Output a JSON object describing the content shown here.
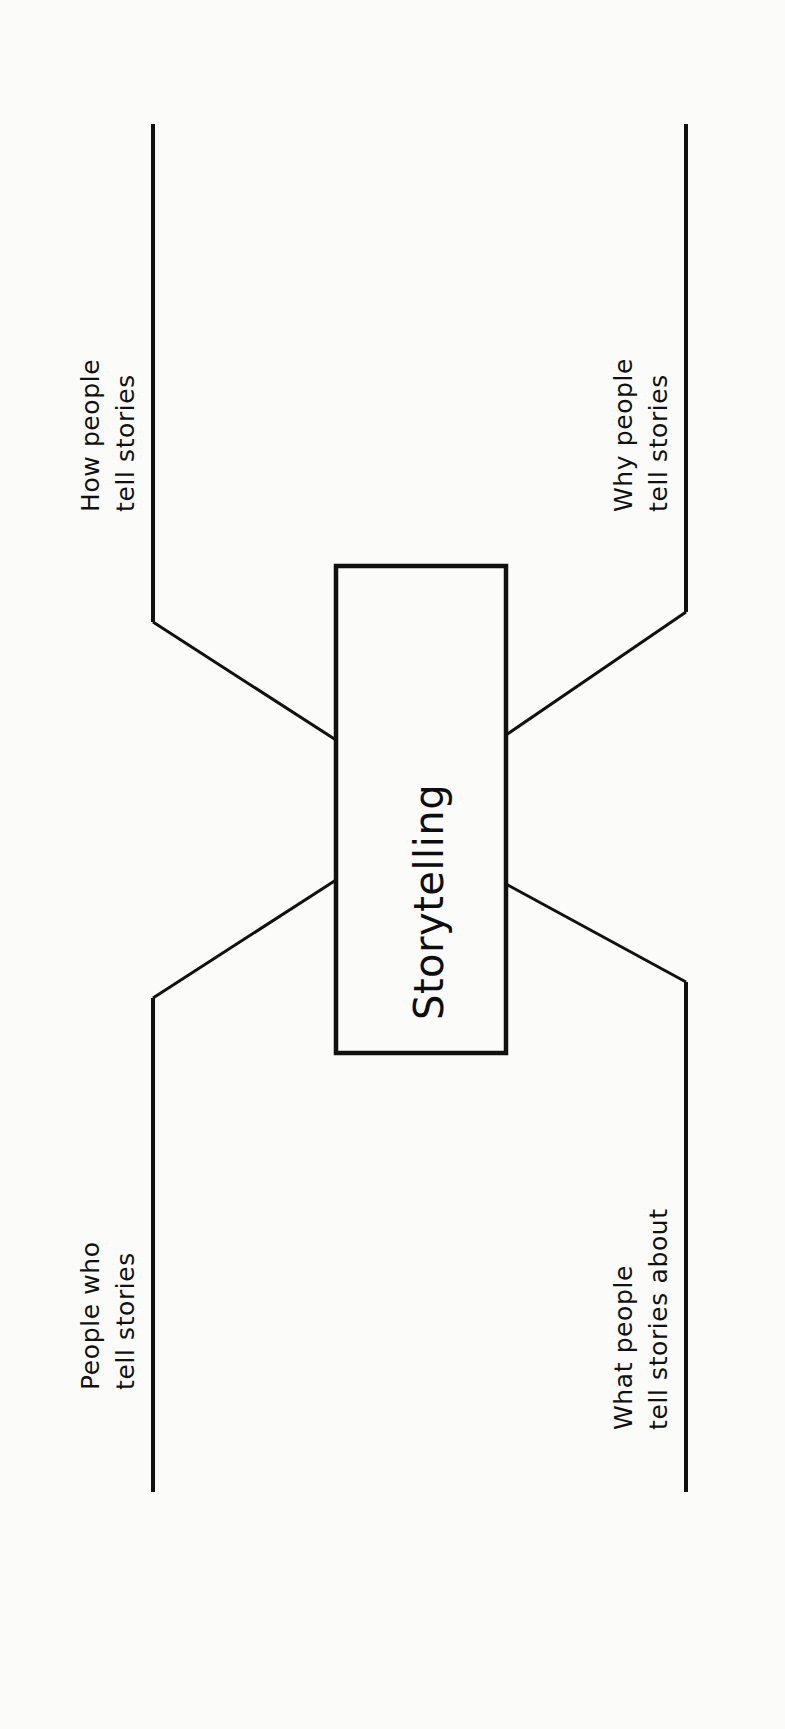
{
  "diagram": {
    "type": "fishbone-spider-diagram",
    "orientation": "rotated-90-counterclockwise",
    "center": {
      "label": "Storytelling"
    },
    "branches": [
      {
        "id": "how-people-tell-stories",
        "position": "top-left",
        "line1": "How people",
        "line2": "tell stories"
      },
      {
        "id": "why-people-tell-stories",
        "position": "top-right",
        "line1": "Why people",
        "line2": "tell stories"
      },
      {
        "id": "people-who-tell-stories",
        "position": "bottom-left",
        "line1": "People who",
        "line2": "tell stories"
      },
      {
        "id": "what-people-tell-stories-about",
        "position": "bottom-right",
        "line1": "What people",
        "line2": "tell stories about"
      }
    ],
    "colors": {
      "background": "#fbfbfa",
      "ink": "#111111"
    }
  }
}
